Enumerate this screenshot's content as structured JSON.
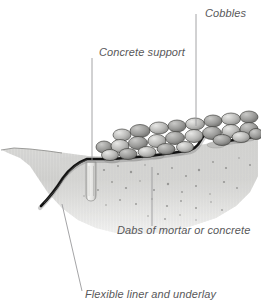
{
  "figure": {
    "background_color": "#ffffff"
  },
  "labels": {
    "cobbles": "Cobbles",
    "concrete_support": "Concrete support",
    "dabs_of_mortar": "Dabs of mortar or concrete",
    "flexible_liner": "Flexible liner and underlay"
  },
  "colors": {
    "label_text": "#58585a",
    "leader_line": "#9a9a9c",
    "liner": "#1a1a1a",
    "soil_fill": "#d8d8d6",
    "soil_shadow": "#b4b4b2",
    "cobble_light": "#d5d5d3",
    "cobble_mid": "#a8a8a6",
    "cobble_dark": "#6f6f6d",
    "cobble_outline": "#3a3a38",
    "concrete_block": "#eeeeec"
  },
  "elements": {
    "cobbles_name": "cobbles-layer",
    "liner_name": "flexible-liner-line",
    "concrete_block_name": "concrete-support-block",
    "mortar_dabs_name": "mortar-dabs",
    "soil_name": "soil-section",
    "ground_line_name": "ground-surface-line"
  },
  "leaders": {
    "cobbles": "vertical line from label down to cobble layer",
    "concrete_support": "vertical line from label down to support block",
    "dabs_of_mortar": "vertical line from liner down to label",
    "flexible_liner": "diagonal line from liner edge down to label"
  }
}
